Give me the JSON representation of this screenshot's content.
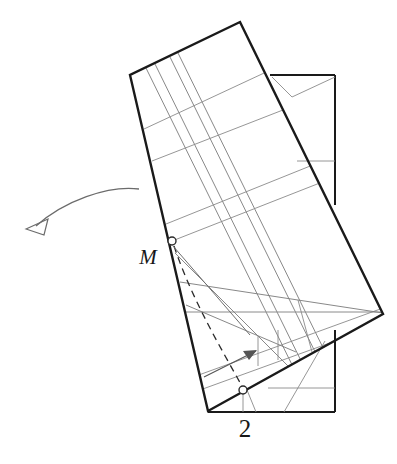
{
  "figure": {
    "caption_number": "2",
    "point_label": "M",
    "background": "#ffffff",
    "colors": {
      "outline_dark": "#1a1a1a",
      "construction_gray": "#8a8a8a",
      "construction_dark_gray": "#6e6e6e",
      "marker_fill": "#ffffff",
      "marker_stroke": "#2b2b2b",
      "arrow_stroke": "#6b6b6b",
      "text": "#171717"
    },
    "labels": [
      {
        "name": "point-label-m",
        "text": "M",
        "x": 148,
        "y": 264,
        "style": "italic-serif"
      },
      {
        "name": "figure-number-label",
        "text": "2",
        "x": 245,
        "y": 437,
        "style": "serif"
      }
    ],
    "markers": [
      {
        "name": "point-marker-m",
        "x": 172,
        "y": 241,
        "r": 4
      },
      {
        "name": "point-marker-lower",
        "x": 243,
        "y": 390,
        "r": 4
      }
    ],
    "shapes": {
      "tilted_rectangle": {
        "name": "tilted-rectangle",
        "vertices": [
          [
            240,
            22
          ],
          [
            383,
            314
          ],
          [
            208,
            411
          ],
          [
            130,
            75
          ]
        ],
        "stroke_width": 2.4
      },
      "background_rectangle": {
        "name": "background-rectangle",
        "vertices": [
          [
            270,
            75
          ],
          [
            335,
            75
          ],
          [
            335,
            412
          ],
          [
            208,
            412
          ]
        ],
        "stroke_width": 2.0
      }
    },
    "arrow": {
      "name": "rotation-direction-arrow",
      "path": "M 138,190 C 110,186 66,200 38,224",
      "head": [
        [
          38,
          224
        ],
        [
          52,
          219
        ],
        [
          46,
          234
        ]
      ]
    },
    "inner_arrow": {
      "name": "inner-direction-arrow",
      "path": "M 204,377 L 258,350",
      "head": [
        [
          258,
          350
        ],
        [
          245,
          350
        ],
        [
          251,
          359
        ]
      ]
    }
  }
}
